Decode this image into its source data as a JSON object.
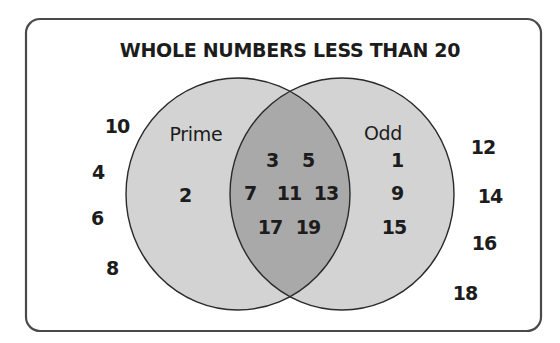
{
  "diagram": {
    "title": "WHOLE NUMBERS LESS THAN 20",
    "type": "venn",
    "colors": {
      "background": "#ffffff",
      "border": "#4a4a4a",
      "circle_fill": "#d3d3d3",
      "intersection_fill": "#a9a9a9",
      "circle_stroke": "#2a2a2a",
      "text": "#1c1c1c"
    },
    "sets": {
      "left": {
        "label": "Prime",
        "only_items": [
          {
            "value": "2",
            "x": 185,
            "y": 195
          }
        ]
      },
      "right": {
        "label": "Odd",
        "only_items": [
          {
            "value": "1",
            "x": 397,
            "y": 160
          },
          {
            "value": "9",
            "x": 397,
            "y": 193
          },
          {
            "value": "15",
            "x": 394,
            "y": 227
          }
        ]
      },
      "intersection": {
        "items": [
          {
            "value": "3",
            "x": 272,
            "y": 160
          },
          {
            "value": "5",
            "x": 308,
            "y": 160
          },
          {
            "value": "7",
            "x": 250,
            "y": 193
          },
          {
            "value": "11",
            "x": 289,
            "y": 193
          },
          {
            "value": "13",
            "x": 326,
            "y": 193
          },
          {
            "value": "17",
            "x": 270,
            "y": 227
          },
          {
            "value": "19",
            "x": 308,
            "y": 227
          }
        ]
      },
      "outside": {
        "items": [
          {
            "value": "10",
            "x": 117,
            "y": 126
          },
          {
            "value": "4",
            "x": 98,
            "y": 172
          },
          {
            "value": "6",
            "x": 97,
            "y": 218
          },
          {
            "value": "8",
            "x": 112,
            "y": 268
          },
          {
            "value": "12",
            "x": 483,
            "y": 147
          },
          {
            "value": "14",
            "x": 490,
            "y": 196
          },
          {
            "value": "16",
            "x": 484,
            "y": 243
          },
          {
            "value": "18",
            "x": 465,
            "y": 293
          }
        ]
      }
    }
  }
}
